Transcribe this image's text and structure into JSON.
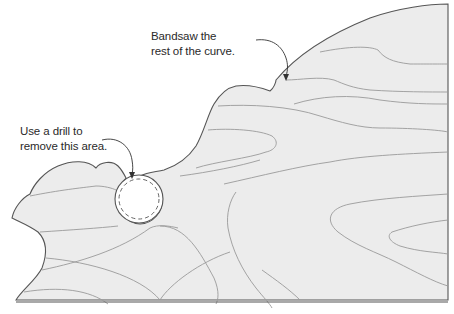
{
  "diagram": {
    "colors": {
      "background": "#ffffff",
      "board_fill": "#ececec",
      "outline": "#555555",
      "grain": "#9a9a9a",
      "hole_fill": "#ffffff",
      "label_text": "#2a2a2a"
    },
    "annotations": [
      {
        "id": "bandsaw",
        "lines": [
          "Bandsaw the",
          "rest of the curve."
        ]
      },
      {
        "id": "drill",
        "lines": [
          "Use a drill to",
          "remove this area."
        ]
      }
    ]
  }
}
